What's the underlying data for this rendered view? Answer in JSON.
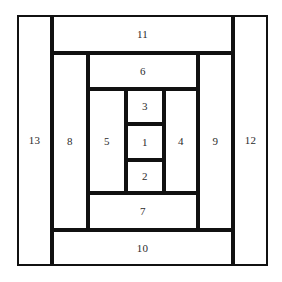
{
  "figure": {
    "background_color": "#ffffff",
    "line_color": "#111111",
    "label_color": "#2b2b2b",
    "outer": {
      "x": 17,
      "y": 15,
      "width": 251,
      "height": 251
    },
    "grid": {
      "vertical_lines": [
        17,
        52,
        88,
        126,
        164,
        198,
        233,
        268
      ],
      "horizontal_lines": [
        15,
        53,
        89,
        124,
        160,
        193,
        230,
        266
      ]
    },
    "cells": [
      {
        "label": "1",
        "x": 126,
        "y": 124,
        "width": 38,
        "height": 36,
        "label_pos": "center"
      },
      {
        "label": "2",
        "x": 126,
        "y": 160,
        "width": 38,
        "height": 33,
        "label_pos": "center"
      },
      {
        "label": "3",
        "x": 126,
        "y": 89,
        "width": 38,
        "height": 35,
        "label_pos": "center"
      },
      {
        "label": "4",
        "x": 164,
        "y": 89,
        "width": 34,
        "height": 104,
        "label_pos": "center"
      },
      {
        "label": "5",
        "x": 88,
        "y": 89,
        "width": 38,
        "height": 104,
        "label_pos": "center"
      },
      {
        "label": "6",
        "x": 88,
        "y": 53,
        "width": 110,
        "height": 36,
        "label_pos": "center"
      },
      {
        "label": "7",
        "x": 88,
        "y": 193,
        "width": 110,
        "height": 37,
        "label_pos": "center"
      },
      {
        "label": "8",
        "x": 52,
        "y": 53,
        "width": 36,
        "height": 177,
        "label_pos": "center"
      },
      {
        "label": "9",
        "x": 198,
        "y": 53,
        "width": 35,
        "height": 177,
        "label_pos": "center"
      },
      {
        "label": "10",
        "x": 52,
        "y": 230,
        "width": 181,
        "height": 36,
        "label_pos": "center"
      },
      {
        "label": "11",
        "x": 52,
        "y": 15,
        "width": 181,
        "height": 38,
        "label_pos": "center"
      },
      {
        "label": "12",
        "x": 233,
        "y": 15,
        "width": 35,
        "height": 251,
        "label_pos": "center"
      },
      {
        "label": "13",
        "x": 17,
        "y": 15,
        "width": 35,
        "height": 251,
        "label_pos": "center"
      }
    ]
  }
}
